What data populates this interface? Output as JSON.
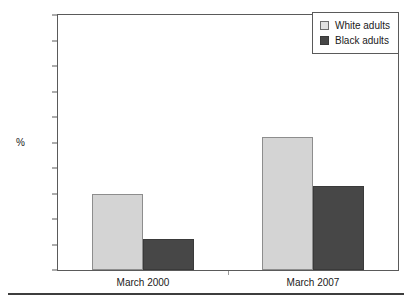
{
  "chart_data": {
    "type": "bar",
    "title": "",
    "subtitle": "",
    "xlabel": "",
    "ylabel": "%",
    "ylim": [
      0,
      100
    ],
    "yticks": [
      0,
      10,
      20,
      30,
      40,
      50,
      60,
      70,
      80,
      90,
      100
    ],
    "ytick_labels": [
      "0",
      "10",
      "20",
      "30",
      "40",
      "50",
      "60",
      "70",
      "80",
      "90",
      "100"
    ],
    "grid": false,
    "legend_position": "top-right",
    "categories": [
      "March 2000",
      "March 2007"
    ],
    "series": [
      {
        "name": "White adults",
        "color": "#d4d4d4",
        "edge_color": "#8d8d8d",
        "values": [
          30,
          52
        ]
      },
      {
        "name": "Black adults",
        "color": "#474747",
        "edge_color": "#3a3a3a",
        "values": [
          12,
          33
        ]
      }
    ]
  },
  "legend": {
    "items": [
      {
        "label": "White adults",
        "swatch": "light-swatch-icon"
      },
      {
        "label": "Black adults",
        "swatch": "dark-swatch-icon"
      }
    ]
  },
  "axes": {
    "y_title": "%",
    "y_labels": [
      "100",
      "90",
      "80",
      "70",
      "60",
      "50",
      "40",
      "30",
      "20",
      "10",
      "0"
    ],
    "x_labels": [
      "March 2000",
      "March 2007"
    ]
  },
  "colors": {
    "series_light": "#d4d4d4",
    "series_dark": "#474747",
    "frame": "#5a5a5a",
    "text": "#1a1a1a",
    "footer_rule": "#3d3d3d",
    "background": "#ffffff"
  }
}
